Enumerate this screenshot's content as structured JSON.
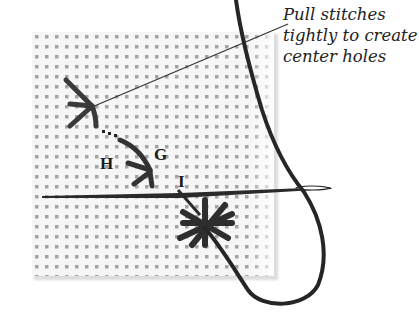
{
  "diagram": {
    "callout": {
      "lines": [
        "Pull stitches",
        "tightly to create",
        "center holes"
      ]
    },
    "labels": {
      "h": "H",
      "g": "G",
      "i": "I"
    },
    "colors": {
      "background": "#ffffff",
      "canvas": "#f4f4f4",
      "canvas_holes": "#9a9a9a",
      "thread": "#2b2b2b",
      "leader_line": "#333333"
    }
  }
}
